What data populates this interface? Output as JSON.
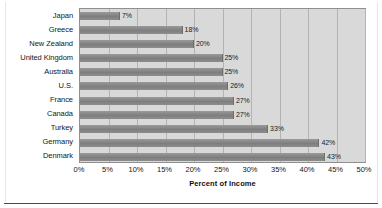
{
  "chart_data": {
    "type": "bar",
    "orientation": "horizontal",
    "title": "",
    "xlabel": "Percent of Income",
    "ylabel": "",
    "xlim": [
      0,
      50
    ],
    "grid": true,
    "legend": "none",
    "xtick_labels": [
      "0%",
      "5%",
      "10%",
      "15%",
      "20%",
      "25%",
      "30%",
      "35%",
      "40%",
      "45%",
      "50%"
    ],
    "xtick_values": [
      0,
      5,
      10,
      15,
      20,
      25,
      30,
      35,
      40,
      45,
      50
    ],
    "categories": [
      "Japan",
      "Greece",
      "New Zealand",
      "United Kingdom",
      "Australia",
      "U.S.",
      "France",
      "Canada",
      "Turkey",
      "Germany",
      "Denmark"
    ],
    "values": [
      7,
      18,
      20,
      25,
      25,
      26,
      27,
      27,
      33,
      42,
      43
    ],
    "data_labels": [
      "7%",
      "18%",
      "20%",
      "25%",
      "25%",
      "26%",
      "27%",
      "27%",
      "33%",
      "42%",
      "43%"
    ],
    "series": [
      {
        "name": "Percent of Income",
        "values": [
          7,
          18,
          20,
          25,
          25,
          26,
          27,
          27,
          33,
          42,
          43
        ]
      }
    ],
    "colors": {
      "bar": "#8c8c8c",
      "plot_background": "#d9d9d9",
      "gridline": "#b3b3b3",
      "plot_border": "#8f8f8f",
      "text": "#161616",
      "page_background": "#ffffff"
    }
  }
}
